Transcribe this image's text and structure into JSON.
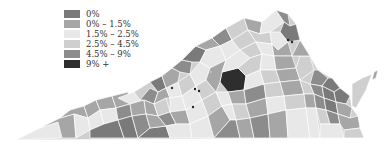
{
  "map": {
    "region": "Virginia",
    "type": "choropleth",
    "legend": {
      "position": "top-left",
      "items": [
        {
          "label": "0%",
          "color": "#7a7a7a"
        },
        {
          "label": "0% – 1.5%",
          "color": "#a6a6a6"
        },
        {
          "label": "1.5% – 2.5%",
          "color": "#e8e8e8"
        },
        {
          "label": "2.5% – 4.5%",
          "color": "#cfcfcf"
        },
        {
          "label": "4.5% – 9%",
          "color": "#8c8c8c"
        },
        {
          "label": "9% +",
          "color": "#2e2e2e"
        }
      ]
    }
  }
}
